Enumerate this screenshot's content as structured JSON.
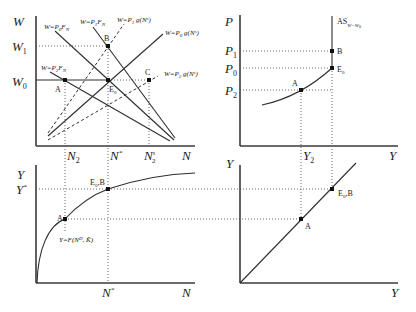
{
  "panels": {
    "labor_market": {
      "y_axis_label": "W",
      "x_axis_label": "N",
      "y_ticks": [
        "W1",
        "W0"
      ],
      "y_ticks_display": {
        "w1": "W",
        "w1_sub": "1",
        "w0": "W",
        "w0_sub": "0"
      },
      "x_ticks_display": {
        "n2": "N",
        "n2_sub": "2",
        "nstar": "N",
        "nstar_sup": "*",
        "n2s": "N",
        "n2s_sup": "s",
        "n2s_sub": "2"
      },
      "curves": [
        {
          "id": "demand_p0",
          "label": "W=P0 FN",
          "style": "solid"
        },
        {
          "id": "demand_p1",
          "label": "W=P1 FN",
          "style": "solid"
        },
        {
          "id": "demand_p2",
          "label": "W=P2 FN",
          "style": "solid"
        },
        {
          "id": "supply_p1",
          "label": "W=P1 g(Ns)",
          "style": "dashed"
        },
        {
          "id": "supply_p0",
          "label": "W=P0 g(Ns)",
          "style": "solid"
        },
        {
          "id": "supply_p2",
          "label": "W=P2 g(Ns)",
          "style": "dashed"
        }
      ],
      "curve_labels": {
        "p0fn": "W=P",
        "p0fn_sub": "0",
        "p0fn_tail": "F",
        "p0fn_tail_sub": "N",
        "p1fn": "W=P",
        "p1fn_sub": "1",
        "p1fn_tail": "F",
        "p1fn_tail_sub": "N",
        "p2fn": "W=P",
        "p2fn_sub": "2",
        "p2fn_tail": "F",
        "p2fn_tail_sub": "N",
        "p1g": "W=P",
        "p1g_sub": "1",
        "p1g_tail": " g(N",
        "p1g_sup": "s",
        "p1g_end": ")",
        "p0g": "W=P",
        "p0g_sub": "0",
        "p0g_tail": " g(N",
        "p0g_sup": "s",
        "p0g_end": ")",
        "p2g": "W=P",
        "p2g_sub": "2",
        "p2g_tail": " g(N",
        "p2g_sup": "s",
        "p2g_end": ")"
      },
      "points": {
        "A": "A",
        "B": "B",
        "C": "C",
        "E0": "E",
        "E0_sub": "0"
      }
    },
    "aggregate_supply": {
      "y_axis_label": "P",
      "x_axis_label": "Y",
      "y_ticks_display": {
        "p1": "P",
        "p1_sub": "1",
        "p0": "P",
        "p0_sub": "0",
        "p2": "P",
        "p2_sub": "2"
      },
      "x_ticks_display": {
        "y2": "Y",
        "y2_sub": "2"
      },
      "as_label": "AS",
      "as_sub": "W=W",
      "as_sub2": "0",
      "points": {
        "A": "A",
        "B": "B",
        "E0": "E",
        "E0_sub": "0"
      }
    },
    "production_function": {
      "y_axis_label": "Y",
      "x_axis_label": "N",
      "y_ticks_display": {
        "ystar": "Y",
        "ystar_sup": "*"
      },
      "x_ticks_display": {
        "nstar": "N",
        "nstar_sup": "*"
      },
      "function_label": "Y=F(N",
      "function_sup": "D",
      "function_tail": ", K̄)",
      "points": {
        "A": "A",
        "E0B": "E",
        "E0B_sub": "0",
        "E0B_tail": ",B"
      }
    },
    "forty_five_degree": {
      "y_axis_label": "Y",
      "x_axis_label": "Y",
      "points": {
        "A": "A",
        "E0B": "E",
        "E0B_sub": "0",
        "E0B_tail": ",B"
      }
    }
  }
}
